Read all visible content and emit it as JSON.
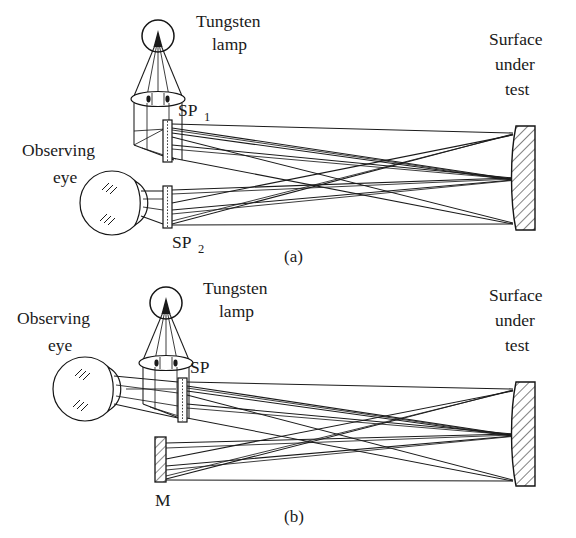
{
  "figure": {
    "background_color": "#ffffff",
    "line_color": "#1a1a1a"
  },
  "panels": [
    {
      "id": "a",
      "caption": "(a)",
      "description": "Two-scatterplate configuration",
      "labels": {
        "lamp": "Tungsten",
        "lamp_line2": "lamp",
        "eye": "Observing",
        "eye_line2": "eye",
        "scatterplate_1_base": "SP",
        "scatterplate_1_sub": "1",
        "scatterplate_2_base": "SP",
        "scatterplate_2_sub": "2",
        "surface": "Surface",
        "surface_line2": "under",
        "surface_line3": "test"
      },
      "components": [
        {
          "name": "tungsten-lamp",
          "type": "light-source",
          "shape": "circle-with-filament"
        },
        {
          "name": "condenser-lens",
          "type": "lens",
          "shape": "ellipse-biconvex"
        },
        {
          "name": "scatterplate-1",
          "type": "scatterplate",
          "label": "SP1"
        },
        {
          "name": "scatterplate-2",
          "type": "scatterplate",
          "label": "SP2"
        },
        {
          "name": "observing-eye",
          "type": "detector",
          "shape": "eyeball"
        },
        {
          "name": "surface-under-test",
          "type": "mirror",
          "shape": "hatched-concave-bar"
        }
      ]
    },
    {
      "id": "b",
      "caption": "(b)",
      "description": "Single-scatterplate with folding mirror configuration",
      "labels": {
        "lamp": "Tungsten",
        "lamp_line2": "lamp",
        "eye": "Observing",
        "eye_line2": "eye",
        "scatterplate": "SP",
        "mirror": "M",
        "surface": "Surface",
        "surface_line2": "under",
        "surface_line3": "test"
      },
      "components": [
        {
          "name": "tungsten-lamp",
          "type": "light-source",
          "shape": "circle-with-filament"
        },
        {
          "name": "condenser-lens",
          "type": "lens",
          "shape": "ellipse-biconvex"
        },
        {
          "name": "scatterplate",
          "type": "scatterplate",
          "label": "SP"
        },
        {
          "name": "flat-mirror",
          "type": "mirror",
          "label": "M",
          "shape": "hatched-bar"
        },
        {
          "name": "observing-eye",
          "type": "detector",
          "shape": "eyeball"
        },
        {
          "name": "surface-under-test",
          "type": "mirror",
          "shape": "hatched-concave-bar"
        }
      ]
    }
  ]
}
